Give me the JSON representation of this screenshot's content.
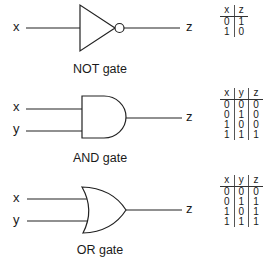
{
  "gates": [
    {
      "type": "NOT",
      "caption": "NOT gate",
      "inputs": [
        "x"
      ],
      "output": "z",
      "truth_table": {
        "headers": [
          "x",
          "z"
        ],
        "rows": [
          [
            "0",
            "1"
          ],
          [
            "1",
            "0"
          ]
        ]
      }
    },
    {
      "type": "AND",
      "caption": "AND gate",
      "inputs": [
        "x",
        "y"
      ],
      "output": "z",
      "truth_table": {
        "headers": [
          "x",
          "y",
          "z"
        ],
        "rows": [
          [
            "0",
            "0",
            "0"
          ],
          [
            "0",
            "1",
            "0"
          ],
          [
            "1",
            "0",
            "0"
          ],
          [
            "1",
            "1",
            "1"
          ]
        ]
      }
    },
    {
      "type": "OR",
      "caption": "OR gate",
      "inputs": [
        "x",
        "y"
      ],
      "output": "z",
      "truth_table": {
        "headers": [
          "x",
          "y",
          "z"
        ],
        "rows": [
          [
            "0",
            "0",
            "0"
          ],
          [
            "0",
            "1",
            "1"
          ],
          [
            "1",
            "0",
            "1"
          ],
          [
            "1",
            "1",
            "1"
          ]
        ]
      }
    }
  ]
}
